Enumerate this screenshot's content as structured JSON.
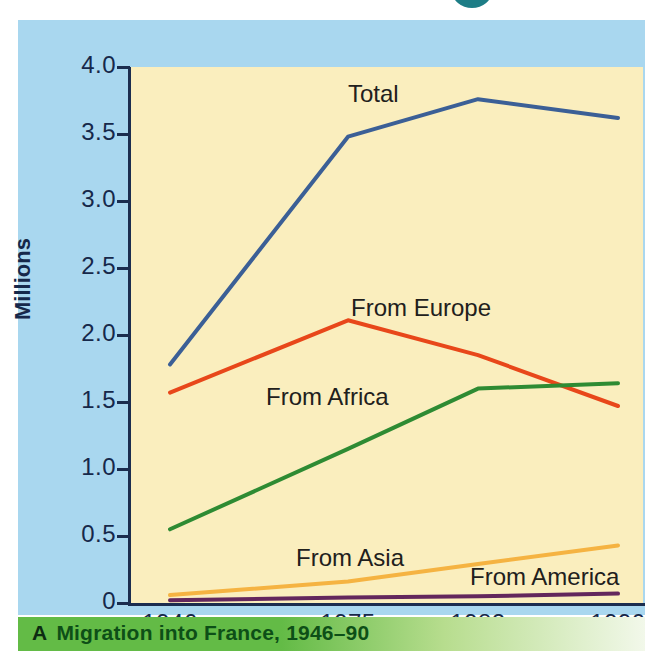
{
  "caption": {
    "letter": "A",
    "text": "Migration into France, 1946–90"
  },
  "colors": {
    "panel_background": "#a9d7ef",
    "plot_background": "#faeebe",
    "axis": "#16284a",
    "caption_bar": "#63bb46",
    "caption_text": "#0d4f17",
    "total": "#3b5f96",
    "europe": "#e8471a",
    "africa": "#2e8b33",
    "asia": "#f5b342",
    "america": "#63275c",
    "top_circle": "#1d7d86"
  },
  "chart_data": {
    "type": "line",
    "title": "Migration into France, 1946–90",
    "xlabel": "",
    "ylabel": "Millions",
    "x": [
      1946,
      1975,
      1982,
      1990
    ],
    "xtick_labels": [
      "1946",
      "1975",
      "1982",
      "1990"
    ],
    "ytick_labels": [
      "0",
      "0.5",
      "1.0",
      "1.5",
      "2.0",
      "2.5",
      "3.0",
      "3.5",
      "4.0"
    ],
    "ytick_values": [
      0,
      0.5,
      1.0,
      1.5,
      2.0,
      2.5,
      3.0,
      3.5,
      4.0
    ],
    "ylim": [
      0,
      4.0
    ],
    "grid": false,
    "legend_position": "inline-labels",
    "series": [
      {
        "name": "Total",
        "label": "Total",
        "color": "#3b5f96",
        "values": [
          1.78,
          3.48,
          3.76,
          3.62
        ]
      },
      {
        "name": "From Europe",
        "label": "From Europe",
        "color": "#e8471a",
        "values": [
          1.57,
          2.11,
          1.85,
          1.47
        ]
      },
      {
        "name": "From Africa",
        "label": "From Africa",
        "color": "#2e8b33",
        "values": [
          0.55,
          1.15,
          1.6,
          1.64
        ]
      },
      {
        "name": "From Asia",
        "label": "From Asia",
        "color": "#f5b342",
        "values": [
          0.06,
          0.16,
          0.29,
          0.43
        ]
      },
      {
        "name": "From America",
        "label": "From America",
        "color": "#63275c",
        "values": [
          0.02,
          0.04,
          0.05,
          0.07
        ]
      }
    ]
  },
  "series_labels": [
    {
      "text": "Total",
      "x": 330,
      "y": 60
    },
    {
      "text": "From Europe",
      "x": 333,
      "y": 274
    },
    {
      "text": "From Africa",
      "x": 248,
      "y": 363
    },
    {
      "text": "From Asia",
      "x": 278,
      "y": 524
    },
    {
      "text": "From America",
      "x": 452,
      "y": 543
    }
  ]
}
